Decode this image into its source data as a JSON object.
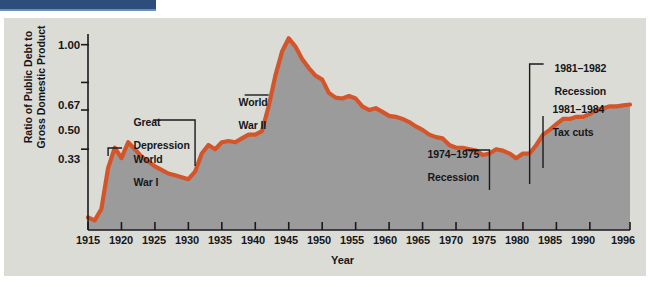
{
  "page": {
    "background_color": "#ffffff",
    "figure_background": "#dcdcd6",
    "header_bar_color": "#2d4d7a"
  },
  "chart_data": {
    "type": "area",
    "title": "",
    "subtitle": "",
    "xlabel": "Year",
    "ylabel": "Ratio of Public Debt to\nGross Domestic Product",
    "xlim": [
      1915,
      1996
    ],
    "ylim": [
      0.14,
      1.12
    ],
    "yscale": "log",
    "grid": false,
    "legend": null,
    "line_color": "#d4552a",
    "fill_color": "#9b9b9b",
    "ytick_labels": [
      "1.00",
      "0.67",
      "0.50",
      "0.33"
    ],
    "ytick_values": [
      1.0,
      0.67,
      0.5,
      0.33
    ],
    "xtick_labels": [
      "1915",
      "1920",
      "1925",
      "1930",
      "1935",
      "1940",
      "1945",
      "1950",
      "1955",
      "1960",
      "1965",
      "1970",
      "1975",
      "1980",
      "1985",
      "1990",
      "1996"
    ],
    "xtick_values": [
      1915,
      1920,
      1925,
      1930,
      1935,
      1940,
      1945,
      1950,
      1955,
      1960,
      1965,
      1970,
      1975,
      1980,
      1985,
      1990,
      1996
    ],
    "series": [
      {
        "name": "Ratio of Public Debt to GDP",
        "x": [
          1915,
          1916,
          1917,
          1918,
          1919,
          1920,
          1921,
          1922,
          1923,
          1924,
          1925,
          1926,
          1927,
          1928,
          1929,
          1930,
          1931,
          1932,
          1933,
          1934,
          1935,
          1936,
          1937,
          1938,
          1939,
          1940,
          1941,
          1942,
          1943,
          1944,
          1945,
          1946,
          1947,
          1948,
          1949,
          1950,
          1951,
          1952,
          1953,
          1954,
          1955,
          1956,
          1957,
          1958,
          1959,
          1960,
          1961,
          1962,
          1963,
          1964,
          1965,
          1966,
          1967,
          1968,
          1969,
          1970,
          1971,
          1972,
          1973,
          1974,
          1975,
          1976,
          1977,
          1978,
          1979,
          1980,
          1981,
          1982,
          1983,
          1984,
          1985,
          1986,
          1987,
          1988,
          1989,
          1990,
          1991,
          1992,
          1993,
          1994,
          1995,
          1996
        ],
        "y": [
          0.16,
          0.155,
          0.175,
          0.27,
          0.335,
          0.3,
          0.355,
          0.33,
          0.305,
          0.29,
          0.275,
          0.265,
          0.255,
          0.25,
          0.245,
          0.24,
          0.26,
          0.315,
          0.345,
          0.33,
          0.355,
          0.36,
          0.355,
          0.37,
          0.385,
          0.385,
          0.4,
          0.52,
          0.72,
          0.93,
          1.07,
          0.98,
          0.86,
          0.78,
          0.72,
          0.69,
          0.6,
          0.57,
          0.565,
          0.58,
          0.565,
          0.52,
          0.5,
          0.51,
          0.49,
          0.47,
          0.465,
          0.455,
          0.44,
          0.42,
          0.405,
          0.385,
          0.375,
          0.37,
          0.345,
          0.335,
          0.335,
          0.33,
          0.325,
          0.31,
          0.315,
          0.33,
          0.325,
          0.315,
          0.3,
          0.315,
          0.315,
          0.345,
          0.385,
          0.405,
          0.43,
          0.455,
          0.455,
          0.465,
          0.465,
          0.48,
          0.5,
          0.51,
          0.52,
          0.52,
          0.525,
          0.53
        ]
      }
    ],
    "annotations": [
      {
        "id": "world-war-i",
        "text": "World\nWar I",
        "x_year": 1918,
        "align": "left"
      },
      {
        "id": "great-depression",
        "text": "Great\nDepression",
        "x_year": 1931,
        "align": "left"
      },
      {
        "id": "world-war-ii",
        "text": "World\nWar II",
        "x_year": 1942,
        "align": "left"
      },
      {
        "id": "recession-1974-75",
        "text": "1974–1975\nRecession",
        "x_year": 1975,
        "align": "left"
      },
      {
        "id": "recession-1981-82",
        "text": "1981–1982\nRecession",
        "x_year": 1981,
        "align": "left"
      },
      {
        "id": "tax-cuts-1981-84",
        "text": "1981–1984\nTax cuts",
        "x_year": 1983,
        "align": "left"
      }
    ]
  },
  "labels": {
    "y_axis_title_line1": "Ratio of Public Debt to",
    "y_axis_title_line2": "Gross Domestic Product",
    "x_axis_title": "Year",
    "ytick_0": "1.00",
    "ytick_1": "0.67",
    "ytick_2": "0.50",
    "ytick_3": "0.33",
    "xtick_0": "1915",
    "xtick_1": "1920",
    "xtick_2": "1925",
    "xtick_3": "1930",
    "xtick_4": "1935",
    "xtick_5": "1940",
    "xtick_6": "1945",
    "xtick_7": "1950",
    "xtick_8": "1955",
    "xtick_9": "1960",
    "xtick_10": "1965",
    "xtick_11": "1970",
    "xtick_12": "1975",
    "xtick_13": "1980",
    "xtick_14": "1985",
    "xtick_15": "1990",
    "xtick_16": "1996",
    "annot_ww1_l1": "World",
    "annot_ww1_l2": "War I",
    "annot_gd_l1": "Great",
    "annot_gd_l2": "Depression",
    "annot_ww2_l1": "World",
    "annot_ww2_l2": "War II",
    "annot_rec74_l1": "1974–1975",
    "annot_rec74_l2": "Recession",
    "annot_rec81_l1": "1981–1982",
    "annot_rec81_l2": "Recession",
    "annot_tax_l1": "1981–1984",
    "annot_tax_l2": "Tax cuts"
  }
}
